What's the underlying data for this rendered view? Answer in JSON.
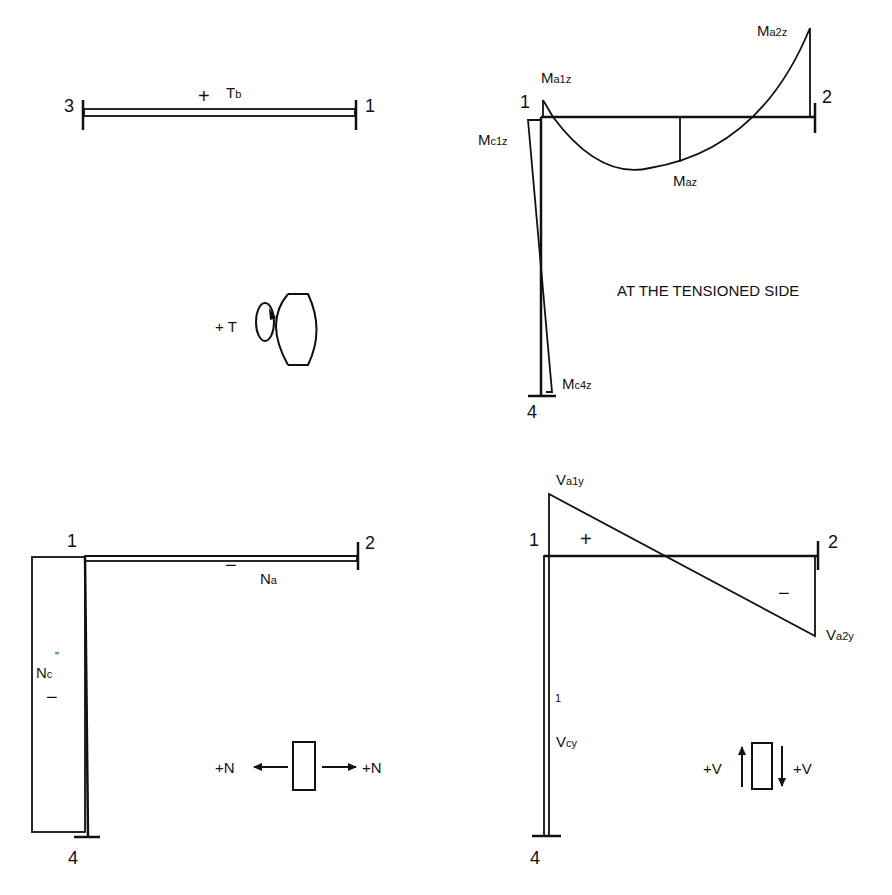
{
  "panels": {
    "torsion": {
      "nodes": {
        "left": "3",
        "right": "1"
      },
      "sign": "+",
      "label_main": "T",
      "label_sub": "b",
      "convention_label": "+ T",
      "convention_icon": "torsion-curl-arrow-icon"
    },
    "moment": {
      "nodes": {
        "n1": "1",
        "n2": "2",
        "n4": "4"
      },
      "labels": {
        "ma1z": {
          "main": "M",
          "sub": "a1z"
        },
        "ma2z": {
          "main": "M",
          "sub": "a2z"
        },
        "maz": {
          "main": "M",
          "sub": "az"
        },
        "mc1z": {
          "main": "M",
          "sub": "c1z"
        },
        "mc4z": {
          "main": "M",
          "sub": "c4z"
        }
      },
      "note": "AT THE TENSIONED SIDE"
    },
    "axial": {
      "nodes": {
        "n1": "1",
        "n2": "2",
        "n4": "4"
      },
      "beam_sign": "−",
      "beam_label": {
        "main": "N",
        "sub": "a"
      },
      "column_label": {
        "main": "N",
        "sub": "c",
        "sup": "\""
      },
      "column_sign": "−",
      "convention_left": "+N",
      "convention_right": "+N"
    },
    "shear": {
      "nodes": {
        "n1": "1",
        "n2": "2",
        "n4": "4"
      },
      "labels": {
        "va1y": {
          "main": "V",
          "sub": "a1y"
        },
        "va2y": {
          "main": "V",
          "sub": "a2y"
        },
        "vcy": {
          "main": "V",
          "sub": "cy"
        }
      },
      "positive_sign": "+",
      "negative_sign": "−",
      "column_tick": "1",
      "convention_left": "+V",
      "convention_right": "+V"
    }
  }
}
